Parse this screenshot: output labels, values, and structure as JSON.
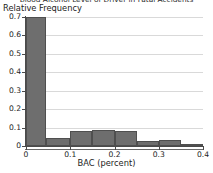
{
  "chart_data": {
    "type": "bar",
    "title": "Blood Alcohol Level of Driver in Fatal Accidents",
    "subtitle": "",
    "xlabel": "BAC (percent)",
    "ylabel": "Relative Frequency",
    "grid": true,
    "legend": null,
    "xlim": [
      0,
      0.4
    ],
    "ylim": [
      0,
      0.7
    ],
    "xticks": [
      "0",
      "0.1",
      "0.2",
      "0.3",
      "0.4"
    ],
    "xtick_values": [
      0,
      0.1,
      0.2,
      0.3,
      0.4
    ],
    "yticks": [
      "0",
      "0.1",
      "0.2",
      "0.3",
      "0.4",
      "0.5",
      "0.6",
      "0.7"
    ],
    "ytick_values": [
      0,
      0.1,
      0.2,
      0.3,
      0.4,
      0.5,
      0.6,
      0.7
    ],
    "bin_edges": [
      0,
      0.045,
      0.1,
      0.15,
      0.2,
      0.25,
      0.3,
      0.35,
      0.4
    ],
    "categories": [
      "0-0.045",
      "0.045-0.1",
      "0.1-0.15",
      "0.15-0.2",
      "0.2-0.25",
      "0.25-0.3",
      "0.3-0.35",
      "0.35-0.4"
    ],
    "values": [
      0.7,
      0.045,
      0.08,
      0.085,
      0.08,
      0.025,
      0.035,
      0.008
    ],
    "bar_color": "#6e6e6e",
    "bar_edge_color": "#4f4f4f"
  }
}
